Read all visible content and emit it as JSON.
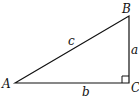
{
  "diagram": {
    "type": "right-triangle",
    "vertices": [
      {
        "id": "A",
        "label": "A",
        "x": 15,
        "y": 83
      },
      {
        "id": "B",
        "label": "B",
        "x": 129,
        "y": 16
      },
      {
        "id": "C",
        "label": "C",
        "x": 129,
        "y": 83
      }
    ],
    "sides": [
      {
        "id": "c",
        "label": "c",
        "from": "A",
        "to": "B"
      },
      {
        "id": "a",
        "label": "a",
        "from": "B",
        "to": "C"
      },
      {
        "id": "b",
        "label": "b",
        "from": "A",
        "to": "C"
      }
    ],
    "right_angle_at": "C",
    "colors": {
      "stroke": "#111111",
      "background": "#ffffff"
    }
  }
}
